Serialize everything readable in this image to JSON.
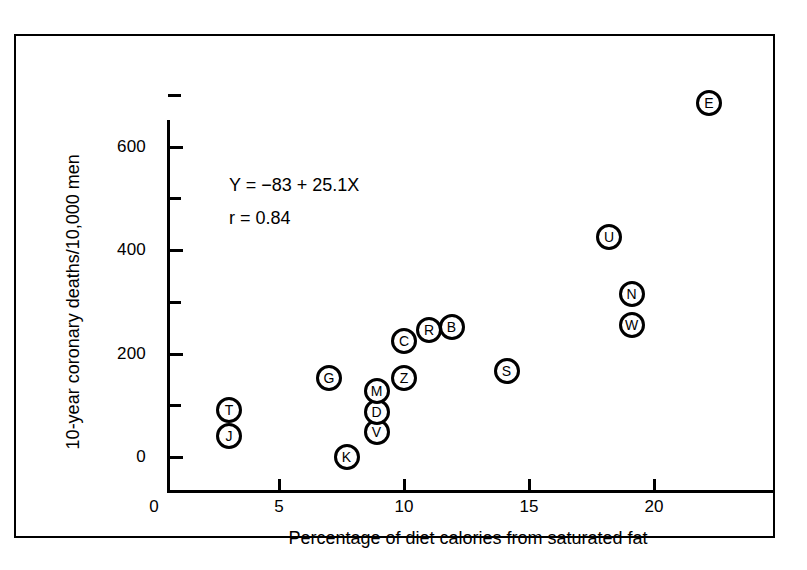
{
  "chart_data": {
    "type": "scatter",
    "title": "",
    "xlabel": "Percentage of diet calories from saturated fat",
    "ylabel": "10-year coronary deaths/10,000 men",
    "xlim": [
      0,
      24.5
    ],
    "ylim": [
      0,
      715
    ],
    "grid": false,
    "legend": "none",
    "x_ticks": [
      0,
      5,
      10,
      15,
      20
    ],
    "x_tick_labels": [
      "0",
      "5",
      "10",
      "15",
      "20"
    ],
    "y_ticks": [
      0,
      200,
      400,
      600
    ],
    "y_tick_labels": [
      "0",
      "200",
      "400",
      "600"
    ],
    "y_minor_ticks": [
      100,
      300,
      500,
      700
    ],
    "point_label_field": "label",
    "annotations": [
      "Y = −83 + 25.1X",
      "r  =  0.84"
    ],
    "regression": {
      "intercept": -83,
      "slope": 25.1,
      "r": 0.84
    },
    "points": [
      {
        "label": "T",
        "x": 3.0,
        "y": 90
      },
      {
        "label": "J",
        "x": 3.0,
        "y": 40
      },
      {
        "label": "K",
        "x": 7.7,
        "y": 0
      },
      {
        "label": "G",
        "x": 7.0,
        "y": 152
      },
      {
        "label": "V",
        "x": 8.9,
        "y": 48
      },
      {
        "label": "D",
        "x": 8.9,
        "y": 87
      },
      {
        "label": "M",
        "x": 8.9,
        "y": 127
      },
      {
        "label": "Z",
        "x": 10.0,
        "y": 152
      },
      {
        "label": "C",
        "x": 10.0,
        "y": 225
      },
      {
        "label": "R",
        "x": 11.0,
        "y": 245
      },
      {
        "label": "B",
        "x": 11.9,
        "y": 252
      },
      {
        "label": "S",
        "x": 14.1,
        "y": 167
      },
      {
        "label": "U",
        "x": 18.2,
        "y": 425
      },
      {
        "label": "W",
        "x": 19.1,
        "y": 255
      },
      {
        "label": "N",
        "x": 19.1,
        "y": 315
      },
      {
        "label": "E",
        "x": 22.2,
        "y": 685
      }
    ]
  },
  "colors": {
    "axis": "#000000",
    "marker_stroke": "#000000",
    "marker_fill": "#ffffff",
    "background": "#ffffff"
  }
}
